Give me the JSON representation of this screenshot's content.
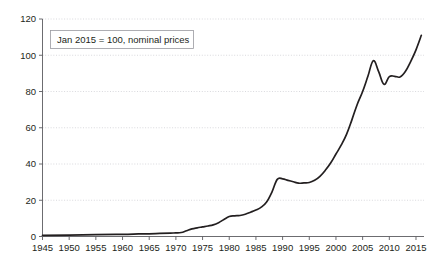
{
  "chart_data": {
    "type": "line",
    "title": "",
    "subtitle": "",
    "xlabel": "",
    "ylabel": "",
    "xlim": [
      1945,
      2016.5
    ],
    "ylim": [
      0,
      120
    ],
    "grid": "horizontal-dotted",
    "legend_position": "none",
    "xticks": [
      1945,
      1950,
      1955,
      1960,
      1965,
      1970,
      1975,
      1980,
      1985,
      1990,
      1995,
      2000,
      2005,
      2010,
      2015
    ],
    "xtick_labels": [
      "1945",
      "1950",
      "1955",
      "1960",
      "1965",
      "1970",
      "1975",
      "1980",
      "1985",
      "1990",
      "1995",
      "2000",
      "2005",
      "2010",
      "2015"
    ],
    "yticks": [
      0,
      20,
      40,
      60,
      80,
      100,
      120
    ],
    "ytick_labels": [
      "0",
      "20",
      "40",
      "60",
      "80",
      "100",
      "120"
    ],
    "annotations": [
      {
        "name": "index-base-note",
        "text": "Jan 2015 = 100, nominal prices"
      }
    ],
    "series": [
      {
        "name": "House price index",
        "color": "#231f20",
        "x": [
          1945,
          1950,
          1955,
          1960,
          1963,
          1965,
          1967,
          1969,
          1970,
          1971,
          1972,
          1973,
          1974,
          1975,
          1976,
          1977,
          1978,
          1979,
          1980,
          1981,
          1982,
          1983,
          1984,
          1985,
          1986,
          1987,
          1988,
          1989,
          1990,
          1991,
          1992,
          1993,
          1994,
          1995,
          1996,
          1997,
          1998,
          1999,
          2000,
          2001,
          2002,
          2003,
          2004,
          2005,
          2006,
          2007,
          2008,
          2009,
          2010,
          2011,
          2012,
          2013,
          2014,
          2015,
          2016
        ],
        "values": [
          0.6,
          0.8,
          1.0,
          1.2,
          1.4,
          1.5,
          1.7,
          1.9,
          2.0,
          2.2,
          3.2,
          4.2,
          4.8,
          5.3,
          5.8,
          6.4,
          7.6,
          9.4,
          11.0,
          11.4,
          11.6,
          12.3,
          13.4,
          14.6,
          16.2,
          19.0,
          24.5,
          31.5,
          31.8,
          31.0,
          30.2,
          29.4,
          29.6,
          29.8,
          31.0,
          33.2,
          36.5,
          40.5,
          45.5,
          50.5,
          56.5,
          64.5,
          73.0,
          80.0,
          88.5,
          97.0,
          91.0,
          84.0,
          88.2,
          88.4,
          88.0,
          91.0,
          96.5,
          103.0,
          111.0
        ]
      }
    ]
  }
}
